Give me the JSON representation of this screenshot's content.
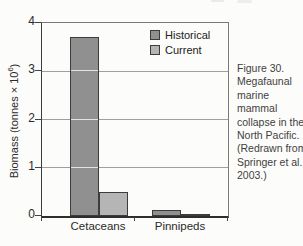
{
  "figure_caption": {
    "text": "Figure 30. Megafaunal marine mammal collapse in the North Pacific. (Redrawn from Springer et al. 2003.)",
    "lines": [
      "Figure 30.",
      "Megafaunal",
      "marine",
      "mammal",
      "collapse in the",
      "North Pacific.",
      "(Redrawn from",
      "Springer et al.",
      "2003.)"
    ]
  },
  "axis": {
    "ylabel_prefix": "Biomass (tonnes × 10",
    "ylabel_sup": "6",
    "ylabel_suffix": ")"
  },
  "chart_data": {
    "type": "bar",
    "title": "",
    "categories": [
      "Cetaceans",
      "Pinnipeds"
    ],
    "series": [
      {
        "name": "Historical",
        "color": "#909090",
        "values": [
          3.7,
          0.12
        ]
      },
      {
        "name": "Current",
        "color": "#b5b5b5",
        "values": [
          0.5,
          0.05
        ]
      }
    ],
    "ylabel": "Biomass (tonnes × 10⁶)",
    "xlabel": "",
    "ylim": [
      0,
      4
    ],
    "yticks": [
      0,
      1,
      2,
      3,
      4
    ],
    "gridlines": [
      1,
      2,
      3
    ],
    "grid": true,
    "legend_position": "top-right-inside",
    "bar_border_color": "#3c3c3c"
  },
  "colors": {
    "background": "#fcfcfa",
    "axis": "#2e2e2e",
    "frame": "#7a7a7a",
    "gridline": "#9e9e9e",
    "gridline_over_bar": "rgba(255,255,255,0.75)",
    "text": "#2b2b2b",
    "caption_text": "#3f3f3f"
  }
}
